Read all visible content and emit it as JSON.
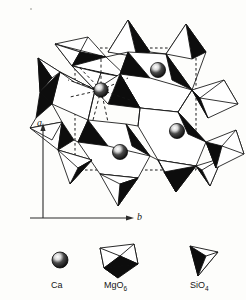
{
  "figure": {
    "kind": "crystal-structure-projection",
    "background_color": "#fdfdfb",
    "line_color": "#111111",
    "fill_light": "#ffffff",
    "fill_dark": "#0d0d0d"
  },
  "axes": {
    "vertical": {
      "label": "a",
      "direction": "up"
    },
    "horizontal": {
      "label": "b",
      "direction": "right"
    },
    "color": "#2b2b2b"
  },
  "unit_cell": {
    "style": "dotted",
    "label": "unit cell outline",
    "x0": 75,
    "y0": 48,
    "x1": 196,
    "y1": 170
  },
  "atoms": {
    "species": "Ca",
    "sphere_color": "#101010",
    "highlight_color": "#f2f2f2",
    "positions": [
      {
        "x": 158,
        "y": 70,
        "name": "ca-atom-upper-right"
      },
      {
        "x": 177,
        "y": 131,
        "name": "ca-atom-right"
      },
      {
        "x": 120,
        "y": 152,
        "name": "ca-atom-lower-left"
      },
      {
        "x": 101,
        "y": 90,
        "name": "ca-atom-coordinated",
        "bonds": "dashed"
      }
    ]
  },
  "legend": {
    "items": [
      {
        "icon": "sphere-icon",
        "label": "Ca",
        "sub": ""
      },
      {
        "icon": "octahedron-icon",
        "label": "MgO",
        "sub": "6"
      },
      {
        "icon": "tetrahedron-icon",
        "label": "SiO",
        "sub": "4"
      }
    ]
  }
}
